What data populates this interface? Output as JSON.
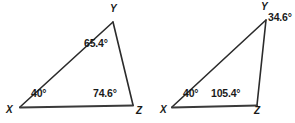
{
  "page": {
    "problem_number": "8.",
    "background_color": "#ffffff",
    "line_color": "#2b2b2b",
    "text_color": "#1a1a1a"
  },
  "figures": [
    {
      "id": "triangle-left",
      "name": "triangle-xyz-left",
      "vertices": [
        {
          "name": "X",
          "label": "X",
          "x": 20,
          "y": 107
        },
        {
          "name": "Y",
          "label": "Y",
          "x": 113,
          "y": 22
        },
        {
          "name": "Z",
          "label": "Z",
          "x": 133,
          "y": 105
        }
      ],
      "vertex_label_positions": [
        {
          "name": "X",
          "x": 6,
          "y": 108
        },
        {
          "name": "Y",
          "x": 110,
          "y": 5
        },
        {
          "name": "Z",
          "x": 136,
          "y": 108
        }
      ],
      "angles": [
        {
          "vertex": "X",
          "value": "40°",
          "x": 31,
          "y": 90
        },
        {
          "vertex": "Y",
          "value": "65.4°",
          "x": 84,
          "y": 38
        },
        {
          "vertex": "Z",
          "value": "74.6°",
          "x": 94,
          "y": 89
        }
      ]
    },
    {
      "id": "triangle-right",
      "name": "triangle-xyz-right",
      "vertices": [
        {
          "name": "X",
          "label": "X",
          "x": 172,
          "y": 107
        },
        {
          "name": "Y",
          "label": "Y",
          "x": 266,
          "y": 20
        },
        {
          "name": "Z",
          "label": "Z",
          "x": 257,
          "y": 105
        }
      ],
      "vertex_label_positions": [
        {
          "name": "X",
          "x": 160,
          "y": 108
        },
        {
          "name": "Y",
          "x": 261,
          "y": 3
        },
        {
          "name": "Z",
          "x": 254,
          "y": 108
        }
      ],
      "angles": [
        {
          "vertex": "X",
          "value": "40°",
          "x": 183,
          "y": 90
        },
        {
          "vertex": "Y",
          "value": "34.6°",
          "x": 268,
          "y": 14
        },
        {
          "vertex": "Z",
          "value": "105.4°",
          "x": 211,
          "y": 90
        }
      ]
    }
  ]
}
